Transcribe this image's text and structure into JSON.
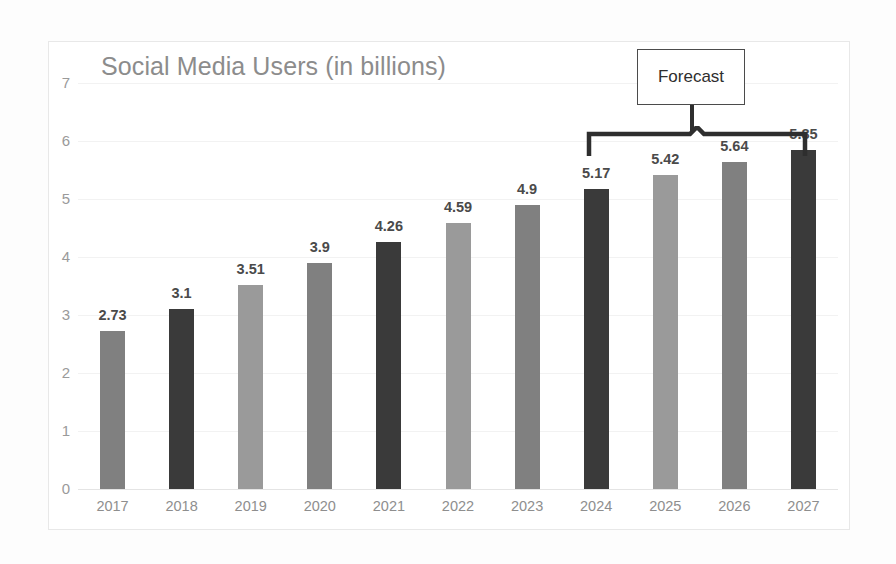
{
  "chart_data": {
    "type": "bar",
    "title": "Social Media Users (in billions)",
    "xlabel": "",
    "ylabel": "",
    "categories": [
      "2017",
      "2018",
      "2019",
      "2020",
      "2021",
      "2022",
      "2023",
      "2024",
      "2025",
      "2026",
      "2027"
    ],
    "values": [
      2.73,
      3.1,
      3.51,
      3.9,
      4.26,
      4.59,
      4.9,
      5.17,
      5.42,
      5.64,
      5.85
    ],
    "value_labels": [
      "2.73",
      "3.1",
      "3.51",
      "3.9",
      "4.26",
      "4.59",
      "4.9",
      "5.17",
      "5.42",
      "5.64",
      "5.85"
    ],
    "ylim": [
      0,
      7
    ],
    "ytick_labels": [
      "7",
      "6",
      "5",
      "4",
      "3",
      "2",
      "1",
      "0"
    ],
    "ytick_values": [
      7,
      6,
      5,
      4,
      3,
      2,
      1,
      0
    ],
    "grid": true,
    "legend": "none",
    "bar_colors": [
      "#808080",
      "#3a3a3a",
      "#9a9a9a",
      "#808080",
      "#3a3a3a",
      "#9a9a9a",
      "#808080",
      "#3a3a3a",
      "#9a9a9a",
      "#808080",
      "#3a3a3a"
    ],
    "annotations": [
      {
        "text": "Forecast",
        "type": "bracket-callout",
        "covers_categories": [
          "2024",
          "2025",
          "2026",
          "2027"
        ]
      }
    ]
  },
  "colors": {
    "title": "#8c8c8c",
    "tick_label": "#8e8e8e",
    "data_label": "#4a4a4a",
    "gridline": "#f2f2f2",
    "baseline": "#e4e4e4",
    "frame_border": "#e8e8e8",
    "annotation": "#2e2e2e",
    "background": "#ffffff"
  }
}
